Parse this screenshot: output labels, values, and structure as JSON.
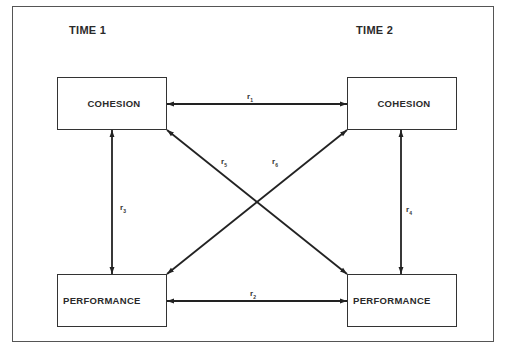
{
  "diagram": {
    "type": "cross-lagged panel",
    "time_labels": {
      "time1": "TIME 1",
      "time2": "TIME 2"
    },
    "nodes": {
      "cohesion_t1": "COHESION",
      "cohesion_t2": "COHESION",
      "performance_t1": "PERFORMANCE",
      "performance_t2": "PERFORMANCE"
    },
    "edges": [
      {
        "id": "r1",
        "symbol": "r",
        "sub": "1",
        "from": "cohesion_t1",
        "to": "cohesion_t2",
        "direction": "bidirectional"
      },
      {
        "id": "r2",
        "symbol": "r",
        "sub": "2",
        "from": "performance_t1",
        "to": "performance_t2",
        "direction": "bidirectional"
      },
      {
        "id": "r3",
        "symbol": "r",
        "sub": "3",
        "from": "cohesion_t1",
        "to": "performance_t1",
        "direction": "bidirectional"
      },
      {
        "id": "r4",
        "symbol": "r",
        "sub": "4",
        "from": "cohesion_t2",
        "to": "performance_t2",
        "direction": "bidirectional"
      },
      {
        "id": "r5",
        "symbol": "r",
        "sub": "5",
        "from": "cohesion_t1",
        "to": "performance_t2",
        "direction": "bidirectional"
      },
      {
        "id": "r6",
        "symbol": "r",
        "sub": "6",
        "from": "performance_t1",
        "to": "cohesion_t2",
        "direction": "bidirectional"
      }
    ],
    "colors": {
      "line": "#222222",
      "background": "#ffffff",
      "frame": "#555555"
    }
  }
}
